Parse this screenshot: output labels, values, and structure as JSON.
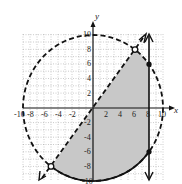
{
  "figure": {
    "axis_labels": {
      "x": "x",
      "y": "y"
    },
    "x_ticks": [
      "-10",
      "-8",
      "-6",
      "-4",
      "-2",
      "2",
      "4",
      "6",
      "8",
      "10"
    ],
    "y_ticks": [
      "10",
      "8",
      "6",
      "4",
      "2",
      "-2",
      "-4",
      "-6",
      "-8",
      "-10"
    ],
    "range": {
      "xmin": -10,
      "xmax": 10,
      "ymin": -10,
      "ymax": 10
    },
    "grid": "dotted, every 1 unit",
    "elements": [
      {
        "type": "circle",
        "equation": "x^2 + y^2 = 100",
        "style": "dashed",
        "radius": 10,
        "note": "solid along lower arc bounding the shaded region"
      },
      {
        "type": "line",
        "equation": "y = 4/3 x",
        "style": "dashed",
        "arrows": "both"
      },
      {
        "type": "vertical_line",
        "equation": "x = 8",
        "style": "solid",
        "arrows": "both"
      },
      {
        "type": "point",
        "x": 6,
        "y": 8,
        "style": "open"
      },
      {
        "type": "point",
        "x": -6,
        "y": -8,
        "style": "open"
      },
      {
        "type": "point",
        "x": 8,
        "y": 6,
        "style": "closed"
      },
      {
        "type": "point",
        "x": 8,
        "y": -6,
        "style": "closed"
      }
    ],
    "shaded_region": "Inside circle, below line y = 4/3 x, left of x = 8",
    "colors": {
      "shade": "#c8c8c8",
      "stroke": "#111111",
      "grid": "#999999"
    }
  }
}
